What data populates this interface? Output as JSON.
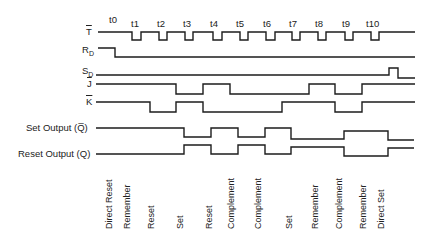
{
  "time_labels": [
    "t0",
    "t1",
    "t2",
    "t3",
    "t4",
    "t5",
    "t6",
    "t7",
    "t8",
    "t9",
    "t10"
  ],
  "signals": {
    "T": {
      "label": "T",
      "overline": true
    },
    "RD": {
      "label": "R",
      "sub": "D"
    },
    "SD": {
      "label": "S",
      "sub": "D"
    },
    "J": {
      "label": "J",
      "overline": true
    },
    "K": {
      "label": "K",
      "overline": true
    },
    "set_output": {
      "label": "Set Output (Q̅)"
    },
    "reset_output": {
      "label": "Reset Output (Q)"
    }
  },
  "events": [
    "Direct Reset",
    "Remember",
    "Reset",
    "Set",
    "Reset",
    "Complement",
    "Complement",
    "Set",
    "Remember",
    "Complement",
    "Remember",
    "Direct Set"
  ]
}
